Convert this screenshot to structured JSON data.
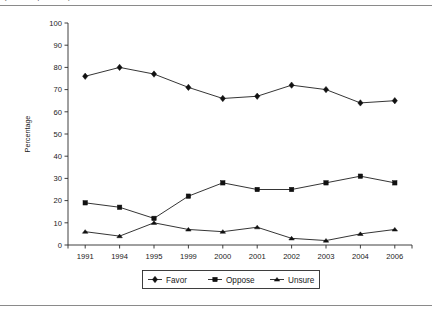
{
  "figure": {
    "caption_partial": "(cut off caption line)",
    "top_rule": true,
    "bottom_rule": true
  },
  "chart_data": {
    "type": "line",
    "title": "",
    "xlabel": "",
    "ylabel": "Percentage",
    "categories": [
      "1991",
      "1994",
      "1995",
      "1999",
      "2000",
      "2001",
      "2002",
      "2003",
      "2004",
      "2006"
    ],
    "ylim": [
      0,
      100
    ],
    "yticks": [
      0,
      10,
      20,
      30,
      40,
      50,
      60,
      70,
      80,
      90,
      100
    ],
    "grid": false,
    "legend_position": "bottom",
    "series": [
      {
        "name": "Favor",
        "marker": "diamond",
        "color": "#111111",
        "values": [
          76,
          80,
          77,
          71,
          66,
          67,
          72,
          70,
          64,
          65
        ]
      },
      {
        "name": "Oppose",
        "marker": "square",
        "color": "#111111",
        "values": [
          19,
          17,
          12,
          22,
          28,
          25,
          25,
          28,
          31,
          28
        ]
      },
      {
        "name": "Unsure",
        "marker": "triangle",
        "color": "#111111",
        "values": [
          6,
          4,
          10,
          7,
          6,
          8,
          3,
          2,
          5,
          7
        ]
      }
    ]
  }
}
